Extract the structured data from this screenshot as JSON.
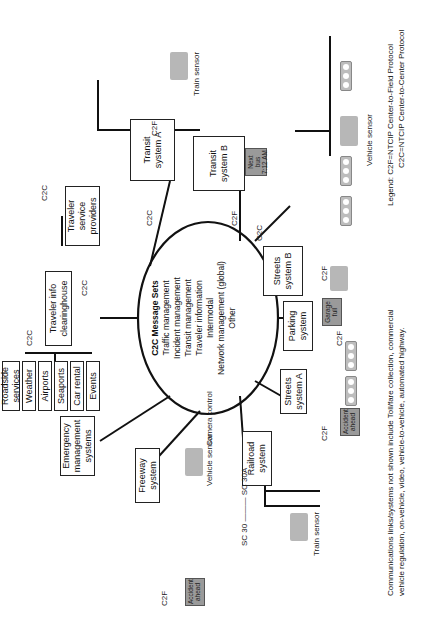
{
  "diagram": {
    "hub": {
      "title": "C2C Message Sets",
      "items": [
        "Traffic management",
        "Incident management",
        "Transit management",
        "Traveler information",
        "Intermodal",
        "Network management (global)",
        "Other"
      ]
    },
    "protocol_labels": {
      "c2c": "C2C",
      "c2f": "C2F"
    },
    "nodes": {
      "transit_a": "Transit system A",
      "transit_b": "Transit system B",
      "streets_b": "Streets system B",
      "parking": "Parking system",
      "streets_a": "Streets system A",
      "railroad": "Railroad system",
      "freeway": "Freeway system",
      "emergency": "Emergency management systems",
      "traveler_info": "Traveler info clearinghouse",
      "traveler_service": "Traveler service providers"
    },
    "info_sources": [
      "Roadside services",
      "Weather",
      "Airports",
      "Seaports",
      "Car rental",
      "Events"
    ],
    "field_devices": {
      "train_sensor": "Train sensor",
      "vehicle_sensor": "Vehicle sensor",
      "camera_control": "Camera control",
      "next_bus_sign": "Next bus 7:12 AM",
      "garage_sign": "Garage full",
      "accident_sign": "Accident ahead",
      "railroad_sign": "SC 30 ——— SC 30A"
    },
    "legend": {
      "title": "Legend:",
      "c2f": "C2F=NTCIP Center-to-Field Protocol",
      "c2c": "C2C=NTCIP Center-to-Center Protocol"
    },
    "footnote": {
      "line1": "Communications links/systems not shown include Toll/fare collection, commercial",
      "line2": "vehicle regulation, on-vehicle, video, vehicle-to-vehicle, automated highway."
    },
    "colors": {
      "line": "#111111",
      "device_gray": "#b7b7b7",
      "sign_gray": "#9a9a9a"
    }
  }
}
